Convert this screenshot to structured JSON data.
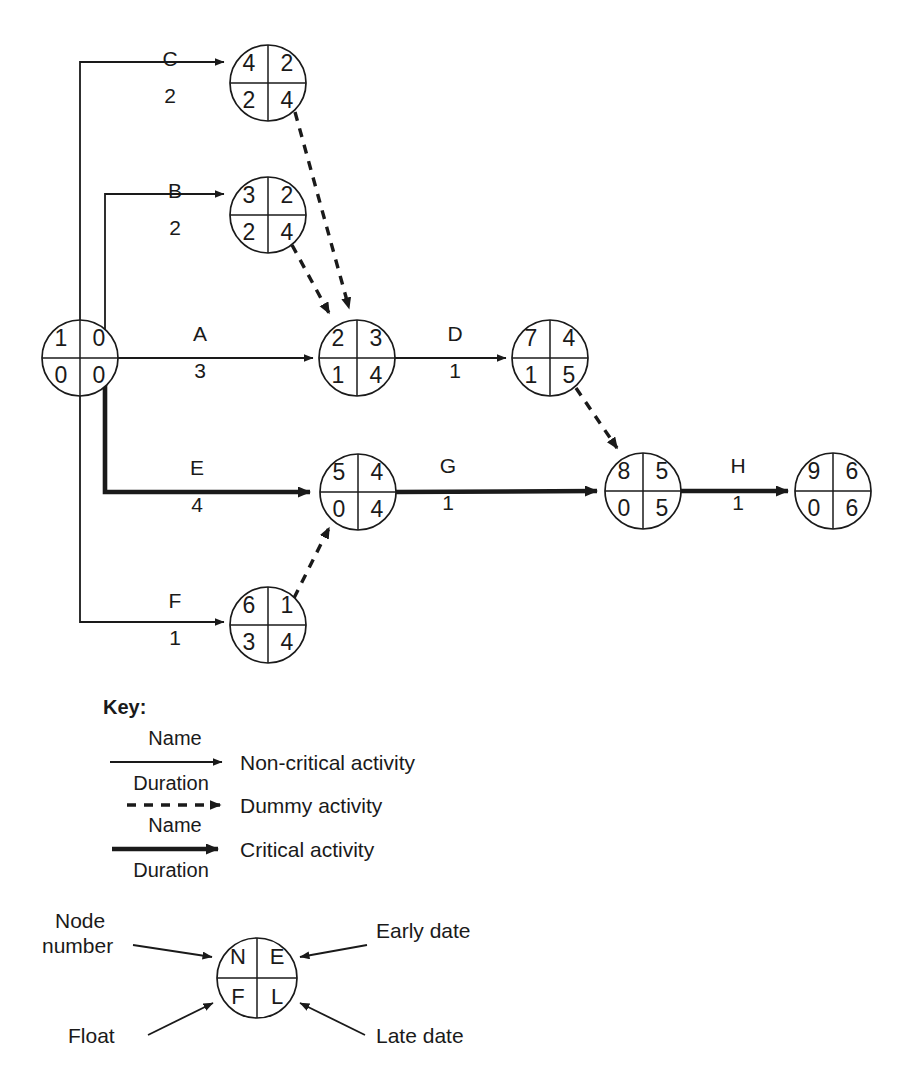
{
  "diagram": {
    "type": "critical-path-network-diagram",
    "nodes": [
      {
        "id": "n1",
        "number": "1",
        "early": "0",
        "float": "0",
        "late": "0",
        "cx": 80,
        "cy": 358
      },
      {
        "id": "n4",
        "number": "4",
        "early": "2",
        "float": "2",
        "late": "4",
        "cx": 268,
        "cy": 83
      },
      {
        "id": "n3",
        "number": "3",
        "early": "2",
        "float": "2",
        "late": "4",
        "cx": 268,
        "cy": 215
      },
      {
        "id": "n2",
        "number": "2",
        "early": "3",
        "float": "1",
        "late": "4",
        "cx": 357,
        "cy": 358
      },
      {
        "id": "n7",
        "number": "7",
        "early": "4",
        "float": "1",
        "late": "5",
        "cx": 550,
        "cy": 358
      },
      {
        "id": "n5",
        "number": "5",
        "early": "4",
        "float": "0",
        "late": "4",
        "cx": 358,
        "cy": 492
      },
      {
        "id": "n8",
        "number": "8",
        "early": "5",
        "float": "0",
        "late": "5",
        "cx": 643,
        "cy": 491
      },
      {
        "id": "n9",
        "number": "9",
        "early": "6",
        "float": "0",
        "late": "6",
        "cx": 833,
        "cy": 491
      },
      {
        "id": "n6",
        "number": "6",
        "early": "1",
        "float": "3",
        "late": "4",
        "cx": 268,
        "cy": 625
      }
    ],
    "node_radius": 38,
    "activities": [
      {
        "name": "C",
        "duration": "2",
        "critical": false,
        "from": "n1",
        "to": "n4",
        "label_x": 170,
        "name_y": 66,
        "duration_y": 103
      },
      {
        "name": "B",
        "duration": "2",
        "critical": false,
        "from": "n1",
        "to": "n3",
        "label_x": 175,
        "name_y": 198,
        "duration_y": 235
      },
      {
        "name": "A",
        "duration": "3",
        "critical": false,
        "from": "n1",
        "to": "n2",
        "label_x": 200,
        "name_y": 341,
        "duration_y": 378
      },
      {
        "name": "D",
        "duration": "1",
        "critical": false,
        "from": "n2",
        "to": "n7",
        "label_x": 455,
        "name_y": 341,
        "duration_y": 378
      },
      {
        "name": "E",
        "duration": "4",
        "critical": true,
        "from": "n1",
        "to": "n5",
        "label_x": 197,
        "name_y": 475,
        "duration_y": 512
      },
      {
        "name": "G",
        "duration": "1",
        "critical": true,
        "from": "n5",
        "to": "n8",
        "label_x": 448,
        "name_y": 473,
        "duration_y": 510
      },
      {
        "name": "H",
        "duration": "1",
        "critical": true,
        "from": "n8",
        "to": "n9",
        "label_x": 738,
        "name_y": 473,
        "duration_y": 510
      },
      {
        "name": "F",
        "duration": "1",
        "critical": false,
        "from": "n1",
        "to": "n6",
        "label_x": 175,
        "name_y": 608,
        "duration_y": 645
      }
    ],
    "dummy_activities": [
      {
        "from": "n4",
        "to": "n2"
      },
      {
        "from": "n3",
        "to": "n2"
      },
      {
        "from": "n7",
        "to": "n8"
      },
      {
        "from": "n6",
        "to": "n5"
      }
    ]
  },
  "key": {
    "title": "Key:",
    "entries": [
      {
        "id": "non-critical",
        "label": "Non-critical activity",
        "arrow_style": "solid-thin",
        "top_text": "Name",
        "bottom_text": "Duration"
      },
      {
        "id": "dummy",
        "label": "Dummy activity",
        "arrow_style": "dashed",
        "top_text": "",
        "bottom_text": ""
      },
      {
        "id": "critical",
        "label": "Critical activity",
        "arrow_style": "solid-thick",
        "top_text": "Name",
        "bottom_text": "Duration"
      }
    ],
    "node_legend": {
      "quadrants": {
        "top_left": "N",
        "top_right": "E",
        "bottom_left": "F",
        "bottom_right": "L"
      },
      "callouts": [
        {
          "id": "node-number",
          "line1": "Node",
          "line2": "number"
        },
        {
          "id": "early-date",
          "line1": "Early date",
          "line2": ""
        },
        {
          "id": "float",
          "line1": "Float",
          "line2": ""
        },
        {
          "id": "late-date",
          "line1": "Late date",
          "line2": ""
        }
      ]
    }
  },
  "colors": {
    "ink": "#1a1a1a",
    "background": "#ffffff"
  }
}
